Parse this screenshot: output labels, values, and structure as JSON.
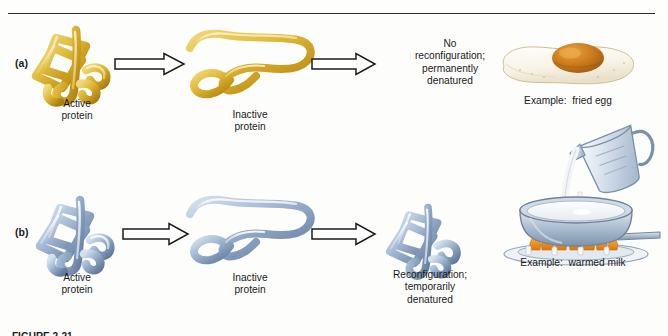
{
  "figure": {
    "title_rule": true,
    "caption_clipped": "FIGURE 2-21",
    "rows": [
      {
        "id": "a",
        "label": "(a)",
        "stage1": {
          "label": "Active\nprotein",
          "art": "folded-protein-yellow",
          "color": "#d8b233"
        },
        "arrow1": {
          "art": "block-arrow-right"
        },
        "stage2": {
          "label": "Inactive\nprotein",
          "art": "unfolded-protein-yellow",
          "color": "#d8b233"
        },
        "arrow2": {
          "art": "block-arrow-right"
        },
        "outcome": {
          "label": "No\nreconfiguration;\npermanently\ndenatured"
        },
        "example": {
          "label": "Example:  fried egg",
          "art": "fried-egg",
          "colors": {
            "yolk": "#c8771f",
            "white": "#f6f2e8"
          }
        }
      },
      {
        "id": "b",
        "label": "(b)",
        "stage1": {
          "label": "Active\nprotein",
          "art": "folded-protein-blue",
          "color": "#8fa8c4"
        },
        "arrow1": {
          "art": "block-arrow-right"
        },
        "stage2": {
          "label": "Inactive\nprotein",
          "art": "unfolded-protein-blue",
          "color": "#8fa8c4"
        },
        "arrow2": {
          "art": "block-arrow-right"
        },
        "outcome": {
          "label": "Reconfiguration;\ntemporarily\ndenatured",
          "art": "refolded-protein-blue"
        },
        "example": {
          "label": "Example:  warmed milk",
          "art": "saucepan-with-milk-and-flames",
          "colors": {
            "pan": "#9db3c9",
            "milk": "#f4f5f3",
            "flame": "#e8921b"
          }
        }
      }
    ],
    "colors": {
      "background": "#fefefd",
      "rule": "#2b2b2b",
      "text": "#1b1b1b",
      "protein_yellow": "#d8b233",
      "protein_blue": "#8fa8c4",
      "arrow_outline": "#1b1b1b"
    }
  }
}
